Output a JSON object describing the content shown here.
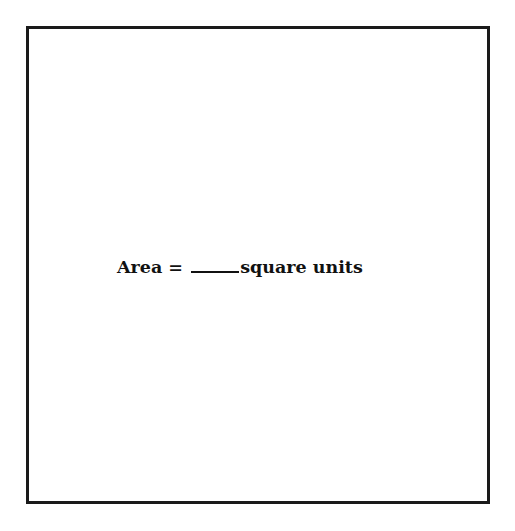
{
  "worksheet": {
    "label": "Area =",
    "blank": "",
    "units": "square units"
  },
  "colors": {
    "border": "#1a1a1a",
    "text": "#111111",
    "background": "#ffffff"
  }
}
